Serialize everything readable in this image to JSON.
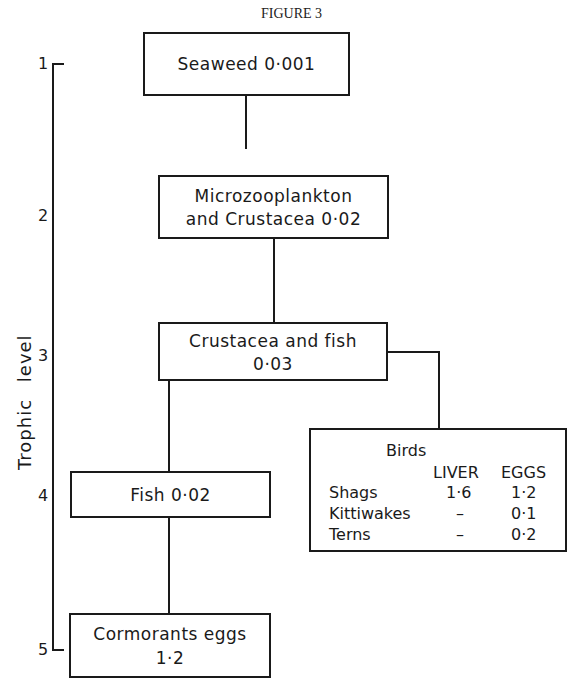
{
  "figure_title": "FIGURE 3",
  "axis": {
    "label": "Trophic level",
    "levels": [
      "1",
      "2",
      "3",
      "4",
      "5"
    ]
  },
  "nodes": {
    "seaweed": {
      "line1": "Seaweed 0·001"
    },
    "microzooplankton": {
      "line1": "Microzooplankton",
      "line2": "and Crustacea 0·02"
    },
    "crustacea_fish": {
      "line1": "Crustacea and fish",
      "line2": "0·03"
    },
    "fish": {
      "line1": "Fish 0·02"
    },
    "cormorants": {
      "line1": "Cormorants eggs",
      "line2": "1·2"
    },
    "birds": {
      "heading": "Birds",
      "columns": [
        "LIVER",
        "EGGS"
      ],
      "rows": [
        {
          "name": "Shags",
          "liver": "1·6",
          "eggs": "1·2"
        },
        {
          "name": "Kittiwakes",
          "liver": "–",
          "eggs": "0·1"
        },
        {
          "name": "Terns",
          "liver": "–",
          "eggs": "0·2"
        }
      ]
    }
  }
}
